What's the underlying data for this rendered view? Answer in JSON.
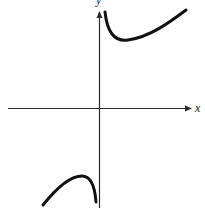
{
  "figure": {
    "type": "function-graph",
    "axes": {
      "x_label": "x",
      "y_label": "y",
      "origin_px": [
        99,
        108
      ]
    },
    "curves": [
      {
        "name": "upper-branch",
        "description": "Starts near vertical asymptote going up, dips to a local minimum, then rises to the right",
        "path": "M 105 12 C 107 30, 113 42, 128 40 C 150 37, 170 22, 186 10"
      },
      {
        "name": "lower-branch",
        "description": "Rises from lower-left to a local maximum, then drops steeply toward the vertical asymptote",
        "path": "M 43 205 C 55 190, 70 176, 82 176 C 91 176, 95 188, 96 202"
      }
    ],
    "colors": {
      "axis": "#2a2a2a",
      "curve": "#111111",
      "background": "#ffffff"
    }
  }
}
